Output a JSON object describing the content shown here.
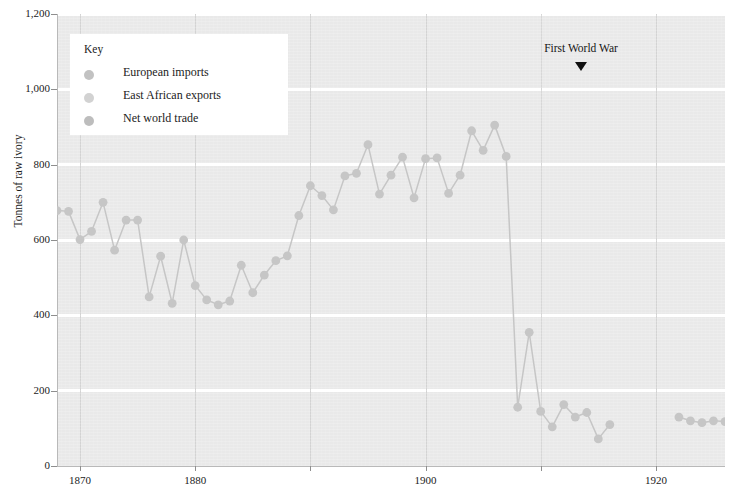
{
  "chart_data": {
    "type": "line",
    "title": "",
    "xlabel": "",
    "ylabel": "Tonnes of raw ivory",
    "xlim": [
      1868,
      1926
    ],
    "ylim": [
      0,
      1200
    ],
    "grid": "horizontal-white-and-vertical-gray",
    "legend_position": "top-left-inside",
    "y_ticks": [
      0,
      200,
      400,
      600,
      800,
      1000,
      1200
    ],
    "y_tick_labels": [
      "0",
      "200",
      "400",
      "600",
      "800",
      "1,000",
      "1,200"
    ],
    "x_ticks": [
      1870,
      1880,
      1890,
      1900,
      1910,
      1920
    ],
    "x_tick_labels": [
      "1870",
      "",
      "",
      "1900",
      "",
      "1920"
    ],
    "x_labeled_ticks": [
      1870,
      1880,
      1900,
      1920
    ],
    "x_gridlines": [
      1870,
      1880,
      1890,
      1900,
      1910,
      1920
    ],
    "annotations": [
      {
        "text": "First World War",
        "x": 1913.5,
        "y": 1105,
        "marker": "down-triangle"
      }
    ],
    "series": [
      {
        "name": "Net world trade",
        "color": "#c6c6c6",
        "marker": "circle",
        "x": [
          1868,
          1869,
          1870,
          1871,
          1872,
          1873,
          1874,
          1875,
          1876,
          1877,
          1878,
          1879,
          1880,
          1881,
          1882,
          1883,
          1884,
          1885,
          1886,
          1887,
          1888,
          1889,
          1890,
          1891,
          1892,
          1893,
          1894,
          1895,
          1896,
          1897,
          1898,
          1899,
          1900,
          1901,
          1902,
          1903,
          1904,
          1905,
          1906,
          1907,
          1908,
          1909,
          1910,
          1911,
          1912,
          1913,
          1914,
          1915,
          1916,
          1922,
          1923,
          1924,
          1925,
          1926
        ],
        "values": [
          678,
          676,
          601,
          623,
          700,
          573,
          653,
          653,
          449,
          557,
          432,
          600,
          479,
          441,
          428,
          438,
          533,
          460,
          507,
          545,
          558,
          665,
          744,
          718,
          680,
          770,
          777,
          853,
          722,
          772,
          820,
          712,
          816,
          818,
          724,
          772,
          890,
          838,
          905,
          822,
          156,
          355,
          145,
          104,
          163,
          130,
          142,
          72,
          110,
          130,
          120,
          115,
          120,
          118
        ]
      }
    ],
    "legend_entries": [
      {
        "label": "European imports",
        "color": "#c2c2c2"
      },
      {
        "label": "East African exports",
        "color": "#d2d2d2"
      },
      {
        "label": "Net world trade",
        "color": "#bdbdbd"
      }
    ]
  },
  "legend": {
    "title": "Key"
  },
  "colors": {
    "plot_background": "#e9e9e9",
    "hgridline": "#ffffff",
    "vgridline": "#d3d3d3",
    "series": "#c6c6c6",
    "text": "#1b1b1b",
    "annotation_marker": "#111111"
  }
}
